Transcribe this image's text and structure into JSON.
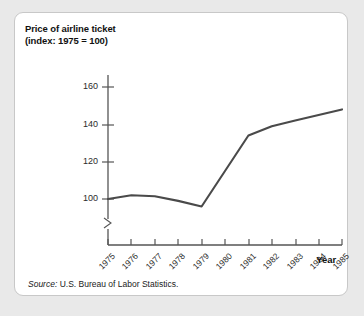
{
  "figure": {
    "y_axis_title": "Price of airline ticket (index: 1975 = 100)",
    "x_axis_title": "Year",
    "source_prefix": "Source:",
    "source_text": "U.S. Bureau of Labor Statistics.",
    "line_color": "#4a4a4a",
    "axis_color": "#555555",
    "background_color": "#ffffff",
    "page_background": "#e9e9e9",
    "border_color": "#c8c8c8"
  },
  "chart_data": {
    "type": "line",
    "title": "",
    "subtitle": "",
    "xlabel": "Year",
    "ylabel": "Price of airline ticket (index: 1975 = 100)",
    "x": [
      1975,
      1976,
      1977,
      1978,
      1979,
      1980,
      1981,
      1982,
      1983,
      1984,
      1985
    ],
    "categories": [
      "1975",
      "1976",
      "1977",
      "1978",
      "1979",
      "1980",
      "1981",
      "1982",
      "1983",
      "1984",
      "1985"
    ],
    "values": [
      100,
      102,
      101.5,
      99,
      96,
      115,
      134,
      139,
      142,
      145,
      148
    ],
    "series": [
      {
        "name": "Price of airline ticket (index: 1975 = 100)",
        "values": [
          100,
          102,
          101.5,
          99,
          96,
          115,
          134,
          139,
          142,
          145,
          148
        ]
      }
    ],
    "ylim": [
      96,
      166
    ],
    "y_ticks": [
      100,
      120,
      140,
      160
    ],
    "y_tick_labels": [
      "100",
      "120",
      "140",
      "160"
    ],
    "x_ticks": [
      "1975",
      "1976",
      "1977",
      "1978",
      "1979",
      "1980",
      "1981",
      "1982",
      "1983",
      "1984",
      "1985"
    ],
    "axis_break": true,
    "grid": false,
    "legend": false,
    "legend_position": "none",
    "annotations": []
  }
}
